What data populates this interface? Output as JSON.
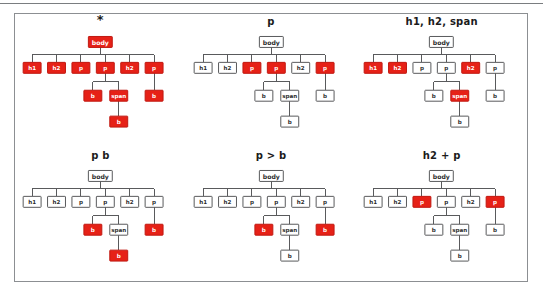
{
  "figure": {
    "panel_count": 6,
    "colors": {
      "highlight": "#e62117",
      "highlight_stroke": "#c01810",
      "node_stroke": "#58595b",
      "node_fill": "#ffffff",
      "border": "#8c8f92",
      "text": "#1b1b1b",
      "highlight_text": "#ffffff"
    }
  },
  "tree": {
    "description": "body with six children: h1, h2, p, p, h2, p. Fourth child p has children b and span; span has child b. Sixth child p has child b.",
    "nodes": {
      "root": "body",
      "c1": "h1",
      "c2": "h2",
      "c3": "p",
      "c4": "p",
      "c5": "h2",
      "c6": "p",
      "c4_b": "b",
      "c4_span": "span",
      "span_b": "b",
      "c6_b": "b"
    }
  },
  "panels": [
    {
      "id": "panel-universal",
      "title": "*",
      "title_is_glyph": true,
      "selector": "*",
      "highlighted": [
        "root",
        "c1",
        "c2",
        "c3",
        "c4",
        "c5",
        "c6",
        "c4_b",
        "c4_span",
        "span_b",
        "c6_b"
      ]
    },
    {
      "id": "panel-type-p",
      "title": "p",
      "title_is_glyph": false,
      "selector": "p",
      "highlighted": [
        "c3",
        "c4",
        "c6"
      ]
    },
    {
      "id": "panel-group",
      "title": "h1, h2, span",
      "title_is_glyph": false,
      "selector": "h1, h2, span",
      "highlighted": [
        "c1",
        "c2",
        "c5",
        "c4_span"
      ]
    },
    {
      "id": "panel-descendant",
      "title": "p b",
      "title_is_glyph": false,
      "selector": "p b",
      "highlighted": [
        "c4_b",
        "span_b",
        "c6_b"
      ]
    },
    {
      "id": "panel-child",
      "title": "p > b",
      "title_is_glyph": false,
      "selector": "p > b",
      "highlighted": [
        "c4_b",
        "c6_b"
      ]
    },
    {
      "id": "panel-adjacent",
      "title": "h2 + p",
      "title_is_glyph": false,
      "selector": "h2 + p",
      "highlighted": [
        "c3",
        "c6"
      ]
    }
  ]
}
